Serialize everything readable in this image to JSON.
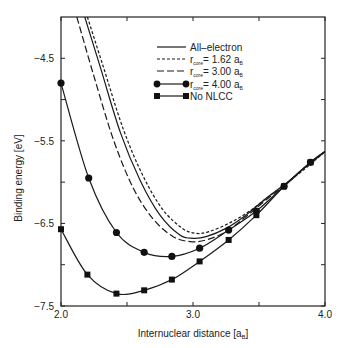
{
  "chart_data": {
    "type": "line",
    "title": "",
    "xlabel": "Internuclear distance [a",
    "xlabel_sub": "B",
    "xlabel_suffix": "]",
    "ylabel": "Binding energy [eV]",
    "xlim": [
      2.0,
      4.0
    ],
    "ylim": [
      -7.5,
      -4.0
    ],
    "x_ticks": [
      2.0,
      2.5,
      3.0,
      3.5,
      4.0
    ],
    "x_tick_labels": [
      "2.0",
      "",
      "3.0",
      "",
      "4.0"
    ],
    "y_ticks": [
      -4.5,
      -5.0,
      -5.5,
      -6.0,
      -6.5,
      -7.0,
      -7.5
    ],
    "y_tick_labels": [
      "-4.5",
      "",
      "-5.5",
      "",
      "-6.5",
      "",
      "-7.5"
    ],
    "grid": false,
    "legend_position": "upper right",
    "series": [
      {
        "name": "All-electron",
        "label_main": "All–electron",
        "style": "solid",
        "marker": "none",
        "x": [
          2.18,
          2.3,
          2.45,
          2.6,
          2.75,
          2.9,
          3.0,
          3.1,
          3.25,
          3.4,
          3.55,
          3.7,
          3.85,
          4.0
        ],
        "y": [
          -4.0,
          -4.62,
          -5.4,
          -5.98,
          -6.4,
          -6.64,
          -6.68,
          -6.66,
          -6.56,
          -6.4,
          -6.2,
          -6.02,
          -5.82,
          -5.63
        ]
      },
      {
        "name": "r_core = 1.62 a_B",
        "label_pre": "r",
        "label_sub": "core",
        "label_mid": "= 1.62 a",
        "label_sub2": "B",
        "style": "short-dash",
        "marker": "none",
        "x": [
          2.2,
          2.32,
          2.47,
          2.62,
          2.77,
          2.92,
          3.02,
          3.12,
          3.27,
          3.42,
          3.57,
          3.72,
          3.87,
          4.0
        ],
        "y": [
          -4.0,
          -4.6,
          -5.35,
          -5.92,
          -6.33,
          -6.56,
          -6.62,
          -6.6,
          -6.5,
          -6.36,
          -6.18,
          -6.0,
          -5.81,
          -5.63
        ]
      },
      {
        "name": "r_core = 3.00 a_B",
        "label_pre": "r",
        "label_sub": "core",
        "label_mid": "= 3.00 a",
        "label_sub2": "B",
        "style": "long-dash",
        "marker": "none",
        "x": [
          2.12,
          2.25,
          2.4,
          2.55,
          2.7,
          2.85,
          2.98,
          3.1,
          3.25,
          3.4,
          3.55,
          3.7,
          3.85,
          4.0
        ],
        "y": [
          -4.0,
          -4.72,
          -5.5,
          -6.08,
          -6.45,
          -6.66,
          -6.72,
          -6.7,
          -6.6,
          -6.42,
          -6.22,
          -6.03,
          -5.82,
          -5.63
        ]
      },
      {
        "name": "r_core = 4.00 a_B",
        "label_pre": "r",
        "label_sub": "core",
        "label_mid": "= 4.00 a",
        "label_sub2": "B",
        "style": "solid",
        "marker": "circle",
        "x": [
          2.0,
          2.21,
          2.42,
          2.63,
          2.84,
          3.05,
          3.27,
          3.48,
          3.69,
          3.89,
          4.0
        ],
        "y": [
          -4.8,
          -5.95,
          -6.61,
          -6.85,
          -6.9,
          -6.8,
          -6.58,
          -6.35,
          -6.05,
          -5.76,
          -5.63
        ]
      },
      {
        "name": "No NLCC",
        "label_main": "No NLCC",
        "style": "solid",
        "marker": "square",
        "x": [
          2.0,
          2.2,
          2.42,
          2.63,
          2.84,
          3.05,
          3.27,
          3.48,
          3.69,
          3.89,
          4.0
        ],
        "y": [
          -6.57,
          -7.12,
          -7.35,
          -7.31,
          -7.18,
          -6.96,
          -6.7,
          -6.4,
          -6.05,
          -5.76,
          -5.63
        ]
      }
    ]
  }
}
